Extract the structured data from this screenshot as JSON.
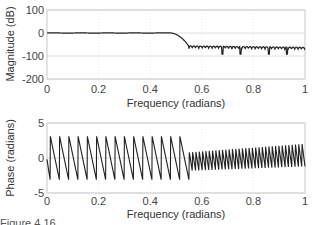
{
  "chart_data": [
    {
      "type": "line",
      "title": "",
      "xlabel": "Frequency (radians)",
      "ylabel": "Magnitude (dB)",
      "xlim": [
        0,
        1
      ],
      "ylim": [
        -200,
        100
      ],
      "xticks": [
        "0",
        "0.2",
        "0.4",
        "0.6",
        "0.8",
        "1"
      ],
      "yticks": [
        "100",
        "0",
        "-100",
        "-200"
      ],
      "grid": true,
      "description": "Lowpass filter magnitude response: ~0 dB passband to ~0.5, transition to ~-55 dB at ~0.55, stopband ripple between ~-55 and ~-80 dB with nulls to ~-95 dB",
      "x": [
        0,
        0.1,
        0.2,
        0.3,
        0.4,
        0.45,
        0.48,
        0.5,
        0.52,
        0.54,
        0.55,
        0.6,
        0.7,
        0.8,
        0.9,
        1.0
      ],
      "values": [
        0,
        0,
        0,
        0,
        1,
        1,
        0,
        -5,
        -20,
        -45,
        -55,
        -62,
        -65,
        -68,
        -70,
        -72
      ]
    },
    {
      "type": "line",
      "title": "",
      "xlabel": "Frequency (radians)",
      "ylabel": "Phase (radians)",
      "xlim": [
        0,
        1
      ],
      "ylim": [
        -5,
        5
      ],
      "xticks": [
        "0",
        "0.2",
        "0.4",
        "0.6",
        "0.8",
        "1"
      ],
      "yticks": [
        "5",
        "0",
        "-5"
      ],
      "grid": true,
      "description": "Wrapped linear phase: sawtooth between ~+3 and ~-3 rad with ~15 periods in passband (0-0.55); smaller-amplitude faster sawtooth (~35 periods) in stopband, amplitude growing toward 1",
      "passband": {
        "x_range": [
          0,
          0.55
        ],
        "teeth": 15,
        "max": 3.1,
        "min": -3.1
      },
      "stopband": {
        "x_range": [
          0.55,
          1.0
        ],
        "teeth": 35,
        "min_start": -1.8,
        "max_start": 0.8,
        "min_end": -1.2,
        "max_end": 2.0
      }
    }
  ],
  "labels": {
    "top_ylabel": "Magnitude (dB)",
    "bottom_ylabel": "Phase (radians)",
    "xlabel": "Frequency (radians)",
    "top_yticks": [
      "100",
      "0",
      "-100",
      "-200"
    ],
    "bottom_yticks": [
      "5",
      "0",
      "-5"
    ],
    "xticks": [
      "0",
      "0.2",
      "0.4",
      "0.6",
      "0.8",
      "1"
    ]
  },
  "caption": {
    "text": "Figure 4.16"
  },
  "colors": {
    "line": "#222222",
    "grid": "#d8d8d8",
    "axis": "#b0b0b0"
  }
}
